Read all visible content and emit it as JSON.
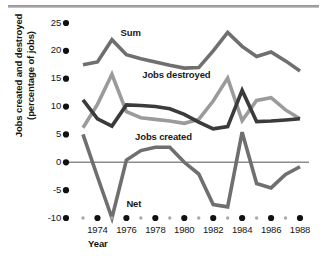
{
  "chart_data": {
    "type": "line",
    "title": "",
    "xlabel": "Year",
    "ylabel": "Jobs created and destroyed (percentage of jobs)",
    "ylabel_line1": "Jobs created and destroyed",
    "ylabel_line2": "(percentage of jobs)",
    "x": [
      1973,
      1974,
      1975,
      1976,
      1977,
      1978,
      1979,
      1980,
      1981,
      1982,
      1983,
      1984,
      1985,
      1986,
      1987,
      1988
    ],
    "xlim": [
      1973,
      1988
    ],
    "ylim": [
      -10,
      25
    ],
    "yticks": [
      25,
      20,
      15,
      10,
      5,
      0,
      -5,
      -10
    ],
    "ytick_labels": [
      "25",
      "20",
      "15",
      "10",
      "5",
      "0",
      "-5",
      "-10"
    ],
    "xticks_major": [
      1974,
      1976,
      1978,
      1980,
      1982,
      1984,
      1986,
      1988
    ],
    "xtick_labels": [
      "1974",
      "1976",
      "1978",
      "1980",
      "1982",
      "1984",
      "1986",
      "1988"
    ],
    "xticks_minor": [
      1973,
      1975,
      1977,
      1979,
      1981,
      1983,
      1985,
      1987
    ],
    "grid": false,
    "legend": "inline-labels",
    "zero_line": true,
    "series": [
      {
        "name": "Sum",
        "color": "#6f6f6f",
        "label_x": 1975.6,
        "label_y": 23.2,
        "values": [
          17.5,
          18.0,
          22.0,
          19.3,
          18.6,
          18.0,
          17.4,
          16.9,
          17.0,
          20.0,
          23.3,
          20.8,
          19.0,
          19.8,
          18.2,
          16.4
        ]
      },
      {
        "name": "Jobs destroyed",
        "color": "#9b9b9b",
        "label_x": 1977.1,
        "label_y": 15.6,
        "values": [
          6.2,
          10.4,
          15.8,
          9.1,
          8.0,
          7.7,
          7.4,
          7.0,
          7.7,
          11.0,
          15.1,
          7.5,
          11.1,
          11.6,
          9.4,
          7.8
        ]
      },
      {
        "name": "Jobs created",
        "color": "#3b3b3b",
        "label_x": 1976.6,
        "label_y": 4.6,
        "values": [
          11.2,
          7.8,
          6.5,
          10.3,
          10.2,
          10.0,
          9.6,
          8.6,
          7.2,
          6.0,
          6.4,
          12.9,
          7.3,
          7.4,
          7.6,
          7.8
        ]
      },
      {
        "name": "Net",
        "color": "#6f6f6f",
        "label_x": 1976.0,
        "label_y": -7.4,
        "values": [
          5.0,
          -2.6,
          -10.0,
          0.4,
          2.1,
          2.7,
          2.7,
          0.0,
          -2.1,
          -7.6,
          -8.0,
          5.4,
          -3.8,
          -4.6,
          -2.2,
          -0.8
        ]
      }
    ]
  }
}
